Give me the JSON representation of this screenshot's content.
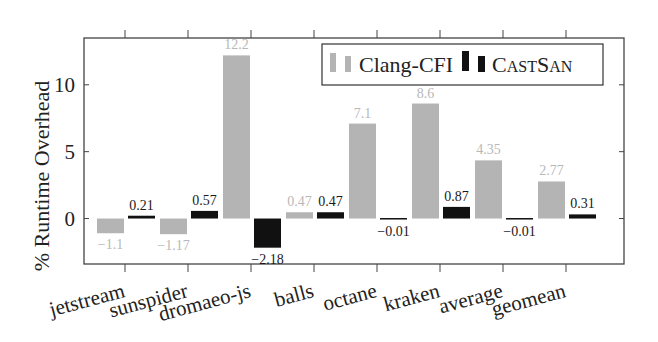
{
  "colors": {
    "clang_cfi": "#b4b4b4",
    "castsan": "#111111",
    "clang_label": "#b8b8b8",
    "castsan_label": "#1a1a1a",
    "axis": "#444444"
  },
  "legend": {
    "items": [
      {
        "label": "Clang-CFI",
        "color": "#b4b4b4"
      },
      {
        "label": "CastSan",
        "color": "#111111"
      }
    ]
  },
  "chart_data": {
    "type": "bar",
    "title": "",
    "xlabel": "",
    "ylabel": "% Runtime Overhead",
    "categories": [
      "jetstream",
      "sunspider",
      "dromaeo-js",
      "balls",
      "octane",
      "kraken",
      "average",
      "geomean"
    ],
    "series": [
      {
        "name": "Clang-CFI",
        "values": [
          -1.1,
          -1.17,
          12.2,
          0.47,
          7.1,
          8.6,
          4.35,
          2.77
        ]
      },
      {
        "name": "CastSan",
        "values": [
          0.21,
          0.57,
          -2.18,
          0.47,
          -0.01,
          0.87,
          -0.01,
          0.31
        ]
      }
    ],
    "ylim": [
      -3.4,
      13.5
    ],
    "yticks": [
      0,
      5,
      10
    ],
    "grid": false,
    "legend_position": "top-right, inside",
    "data_labels": true
  }
}
